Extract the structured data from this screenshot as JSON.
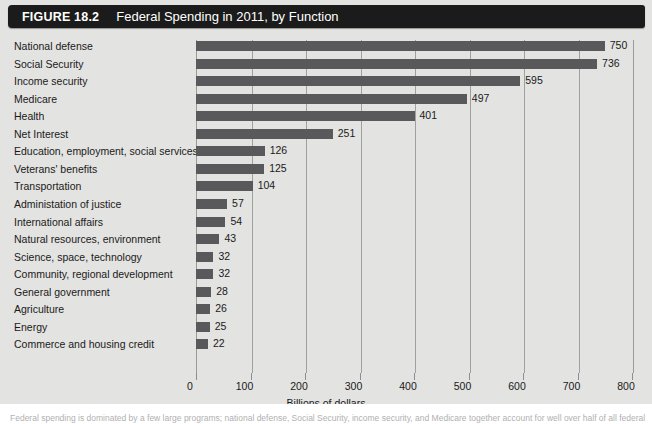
{
  "header": {
    "figure_number": "FIGURE 18.2",
    "title": "Federal Spending in 2011, by Function"
  },
  "caption": {
    "text": "Federal spending is dominated by a few large programs; national defense, Social Security, income security, and Medicare together account for well over half of all federal outlays."
  },
  "colors": {
    "title_bar": "#1b1b1b",
    "title_text": "#ffffff",
    "panel_background": "#e3e3e1",
    "bar": "#59595b",
    "gridline": "#9fa0a0",
    "axis_text": "#1a1a1a"
  },
  "chart_data": {
    "type": "bar",
    "orientation": "horizontal",
    "title": "Federal Spending in 2011, by Function",
    "xlabel": "Billions of dollars",
    "ylabel": "",
    "xlim": [
      0,
      800
    ],
    "xticks": [
      0,
      100,
      200,
      300,
      400,
      500,
      600,
      700,
      800
    ],
    "xtick_labels": [
      "0",
      "100",
      "200",
      "300",
      "400",
      "500",
      "600",
      "700",
      "800"
    ],
    "grid": "vertical",
    "legend": "none",
    "value_labels": true,
    "units": "Billions of dollars",
    "categories": [
      "National defense",
      "Social Security",
      "Income security",
      "Medicare",
      "Health",
      "Net Interest",
      "Education, employment, social services",
      "Veterans' benefits",
      "Transportation",
      "Administation of justice",
      "International affairs",
      "Natural resources, environment",
      "Science, space, technology",
      "Community, regional development",
      "General government",
      "Agriculture",
      "Energy",
      "Commerce and housing credit"
    ],
    "values": [
      750,
      736,
      595,
      497,
      401,
      251,
      126,
      125,
      104,
      57,
      54,
      43,
      32,
      32,
      28,
      26,
      25,
      22
    ],
    "value_label_text": [
      "750",
      "736",
      "595",
      "497",
      "401",
      "251",
      "126",
      "125",
      "104",
      "57",
      "54",
      "43",
      "32",
      "32",
      "28",
      "26",
      "25",
      "22"
    ]
  }
}
